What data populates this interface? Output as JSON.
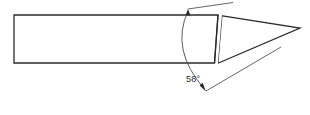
{
  "drawing": {
    "title": "Chisel point angle detail",
    "background_color": "#ffffff",
    "line_color": "#2b2b2b",
    "annotation": {
      "angle_value": "58",
      "degree_symbol": "°",
      "label": "58°"
    },
    "geometry": {
      "body": {
        "name": "tool-shank",
        "left": 14,
        "top": 15,
        "right": 218,
        "bottom": 63
      },
      "bevel_face": {
        "name": "bevel-face",
        "front_edge": [
          [
            218,
            15
          ],
          [
            214,
            63
          ]
        ],
        "back_edge": [
          [
            222,
            16
          ],
          [
            218,
            63
          ]
        ]
      },
      "point": {
        "name": "cutting-point",
        "apex": [
          300,
          28
        ],
        "top_edge": [
          [
            222,
            16
          ],
          [
            300,
            28
          ]
        ],
        "bottom_edge": [
          [
            218,
            63
          ],
          [
            300,
            28
          ]
        ]
      },
      "dimension_arc": {
        "name": "angle-arc",
        "start": [
          188,
          10
        ],
        "end": [
          204,
          88
        ],
        "control": [
          168,
          50
        ]
      },
      "leaders": [
        {
          "name": "upper-leader",
          "from": [
            188,
            10
          ],
          "to": [
            232,
            3
          ]
        },
        {
          "name": "lower-leader",
          "from": [
            204,
            90
          ],
          "to": [
            280,
            48
          ]
        }
      ],
      "arrowheads": [
        {
          "name": "upper-arrowhead",
          "at": [
            188,
            11
          ],
          "angle": 95
        },
        {
          "name": "lower-arrowhead",
          "at": [
            205,
            90
          ],
          "angle": 62
        }
      ],
      "label_position": {
        "x": 186,
        "y": 82
      }
    }
  }
}
